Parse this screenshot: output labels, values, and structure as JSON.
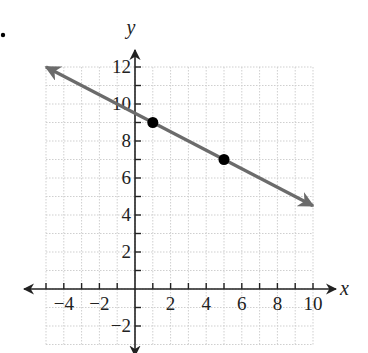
{
  "chart_data": {
    "type": "line",
    "title": "",
    "xlabel": "x",
    "ylabel": "y",
    "xlim": [
      -5,
      10
    ],
    "ylim": [
      -3,
      12
    ],
    "grid": true,
    "x_ticks": [
      -4,
      -2,
      2,
      4,
      6,
      8,
      10
    ],
    "y_ticks": [
      -2,
      2,
      4,
      6,
      8,
      10,
      12
    ],
    "x_tick_labels": [
      "−4",
      "−2",
      "2",
      "4",
      "6",
      "8",
      "10"
    ],
    "y_tick_labels": [
      "−2",
      "2",
      "4",
      "6",
      "8",
      "10",
      "12"
    ],
    "series": [
      {
        "name": "line",
        "equation": "y = -0.5x + 9.5",
        "x": [
          -5,
          10
        ],
        "y": [
          12,
          4.5
        ],
        "color": "#6b6b6b",
        "arrows": "both"
      }
    ],
    "points": [
      {
        "x": 1,
        "y": 9
      },
      {
        "x": 5,
        "y": 7
      }
    ]
  },
  "labels": {
    "x_axis": "x",
    "y_axis": "y",
    "marker": "."
  },
  "colors": {
    "line": "#6b6b6b",
    "grid": "#cfcfcf",
    "axis": "#222222",
    "point": "#000000"
  }
}
